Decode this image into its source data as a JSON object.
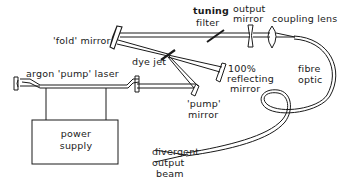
{
  "diagram": {
    "labels": {
      "fold_mirror": "'fold' mirror",
      "tuning_filter_1": "tuning",
      "tuning_filter_2": "filter",
      "output_mirror_1": "output",
      "output_mirror_2": "mirror",
      "coupling_lens": "coupling lens",
      "dye_jet": "dye jet",
      "reflecting_mirror_1": "100%",
      "reflecting_mirror_2": "reflecting",
      "reflecting_mirror_3": "mirror",
      "fibre_optic_1": "fibre",
      "fibre_optic_2": "optic",
      "argon_laser": "argon 'pump' laser",
      "pump_mirror_1": "'pump'",
      "pump_mirror_2": "mirror",
      "power_supply_1": "power",
      "power_supply_2": "supply",
      "divergent_1": "divergent",
      "divergent_2": "output",
      "divergent_3": "beam"
    },
    "colors": {
      "line": "#1a1a1a",
      "background": "#ffffff"
    }
  }
}
